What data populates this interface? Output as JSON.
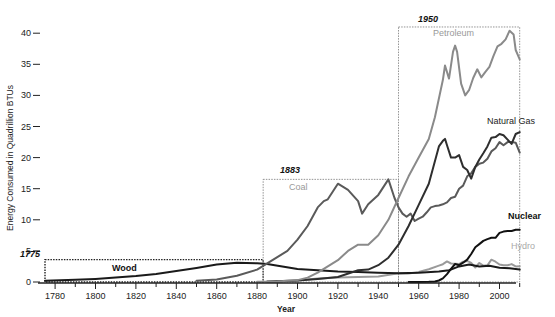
{
  "chart_data": {
    "type": "line",
    "title": "",
    "xlabel": "Year",
    "ylabel": "Energy Consumed in Quadrillion BTUs",
    "xlim": [
      1775,
      2010
    ],
    "ylim": [
      0,
      41
    ],
    "x_ticks": [
      1780,
      1800,
      1820,
      1840,
      1860,
      1880,
      1900,
      1920,
      1940,
      1960,
      1980,
      2000
    ],
    "y_ticks": [
      0,
      5,
      10,
      15,
      20,
      25,
      30,
      35,
      40
    ],
    "grid": false,
    "legend": "inline labels",
    "annotations": [
      {
        "label": "1775",
        "box": {
          "x0": 1775,
          "x1": 1883,
          "y0": 0,
          "y1": 3.6
        }
      },
      {
        "label": "1883",
        "box": {
          "x0": 1883,
          "x1": 1950,
          "y0": 0,
          "y1": 16.5
        }
      },
      {
        "label": "1950",
        "box": {
          "x0": 1950,
          "x1": 2010,
          "y0": 0,
          "y1": 41
        }
      }
    ],
    "series": [
      {
        "name": "Wood",
        "color": "#1a1a1a",
        "label_pos": [
          1812,
          2.5
        ],
        "points": [
          [
            1775,
            0.2
          ],
          [
            1790,
            0.35
          ],
          [
            1800,
            0.5
          ],
          [
            1810,
            0.7
          ],
          [
            1820,
            0.95
          ],
          [
            1830,
            1.3
          ],
          [
            1840,
            1.75
          ],
          [
            1850,
            2.25
          ],
          [
            1860,
            2.8
          ],
          [
            1870,
            3.1
          ],
          [
            1880,
            3.0
          ],
          [
            1885,
            2.9
          ],
          [
            1900,
            2.1
          ],
          [
            1910,
            1.9
          ],
          [
            1920,
            1.7
          ],
          [
            1930,
            1.6
          ],
          [
            1940,
            1.5
          ],
          [
            1950,
            1.4
          ],
          [
            1960,
            1.5
          ],
          [
            1970,
            1.7
          ],
          [
            1975,
            1.9
          ],
          [
            1980,
            2.5
          ],
          [
            1985,
            2.8
          ],
          [
            1990,
            2.5
          ],
          [
            1995,
            2.6
          ],
          [
            2000,
            2.3
          ],
          [
            2005,
            2.2
          ],
          [
            2010,
            2.0
          ]
        ]
      },
      {
        "name": "Coal",
        "color": "#5a5a5a",
        "label_pos": [
          1886,
          15.0
        ],
        "points": [
          [
            1850,
            0.2
          ],
          [
            1860,
            0.4
          ],
          [
            1870,
            1.0
          ],
          [
            1880,
            2.0
          ],
          [
            1885,
            3.0
          ],
          [
            1890,
            4.0
          ],
          [
            1895,
            5.0
          ],
          [
            1900,
            6.8
          ],
          [
            1905,
            9.0
          ],
          [
            1910,
            12.0
          ],
          [
            1913,
            13.0
          ],
          [
            1915,
            13.3
          ],
          [
            1920,
            15.8
          ],
          [
            1925,
            14.8
          ],
          [
            1930,
            13.0
          ],
          [
            1932,
            11.0
          ],
          [
            1935,
            12.5
          ],
          [
            1940,
            14.0
          ],
          [
            1945,
            16.5
          ],
          [
            1948,
            13.5
          ],
          [
            1950,
            12.0
          ],
          [
            1952,
            11.0
          ],
          [
            1954,
            10.5
          ],
          [
            1956,
            11.0
          ],
          [
            1958,
            9.8
          ],
          [
            1960,
            10.2
          ],
          [
            1962,
            10.5
          ],
          [
            1964,
            11.2
          ],
          [
            1966,
            12.0
          ],
          [
            1968,
            12.2
          ],
          [
            1970,
            12.3
          ],
          [
            1972,
            12.5
          ],
          [
            1974,
            12.8
          ],
          [
            1976,
            13.5
          ],
          [
            1978,
            13.7
          ],
          [
            1980,
            15.0
          ],
          [
            1982,
            15.5
          ],
          [
            1984,
            17.0
          ],
          [
            1986,
            17.5
          ],
          [
            1988,
            18.5
          ],
          [
            1990,
            19.0
          ],
          [
            1992,
            19.2
          ],
          [
            1994,
            19.8
          ],
          [
            1996,
            21.0
          ],
          [
            1998,
            21.5
          ],
          [
            2000,
            22.5
          ],
          [
            2002,
            22.0
          ],
          [
            2004,
            22.5
          ],
          [
            2006,
            22.5
          ],
          [
            2008,
            22.4
          ],
          [
            2010,
            20.8
          ]
        ]
      },
      {
        "name": "Petroleum",
        "color": "#8a8a8a",
        "label_pos": [
          1955,
          38.5
        ],
        "points": [
          [
            1880,
            0.05
          ],
          [
            1890,
            0.1
          ],
          [
            1900,
            0.3
          ],
          [
            1905,
            0.7
          ],
          [
            1910,
            1.5
          ],
          [
            1915,
            2.5
          ],
          [
            1920,
            3.5
          ],
          [
            1925,
            5.0
          ],
          [
            1930,
            6.0
          ],
          [
            1935,
            6.0
          ],
          [
            1940,
            7.5
          ],
          [
            1945,
            10.0
          ],
          [
            1950,
            13.5
          ],
          [
            1955,
            17.0
          ],
          [
            1960,
            20.0
          ],
          [
            1965,
            23.0
          ],
          [
            1968,
            26.5
          ],
          [
            1970,
            29.5
          ],
          [
            1972,
            32.5
          ],
          [
            1973,
            34.8
          ],
          [
            1975,
            32.7
          ],
          [
            1977,
            37.0
          ],
          [
            1978,
            38.0
          ],
          [
            1979,
            37.0
          ],
          [
            1981,
            31.9
          ],
          [
            1983,
            30.0
          ],
          [
            1985,
            30.9
          ],
          [
            1987,
            32.8
          ],
          [
            1989,
            34.2
          ],
          [
            1991,
            32.9
          ],
          [
            1993,
            33.8
          ],
          [
            1995,
            34.6
          ],
          [
            1997,
            36.3
          ],
          [
            1999,
            37.9
          ],
          [
            2001,
            38.3
          ],
          [
            2003,
            39.0
          ],
          [
            2005,
            40.4
          ],
          [
            2007,
            39.8
          ],
          [
            2008,
            37.3
          ],
          [
            2010,
            35.8
          ]
        ]
      },
      {
        "name": "Natural Gas",
        "color": "#2e2e2e",
        "label_pos": [
          1982,
          26.0
        ],
        "points": [
          [
            1885,
            0.1
          ],
          [
            1900,
            0.25
          ],
          [
            1910,
            0.5
          ],
          [
            1920,
            0.8
          ],
          [
            1930,
            1.9
          ],
          [
            1935,
            2.0
          ],
          [
            1940,
            2.7
          ],
          [
            1945,
            3.9
          ],
          [
            1950,
            6.0
          ],
          [
            1955,
            9.0
          ],
          [
            1960,
            12.4
          ],
          [
            1965,
            15.8
          ],
          [
            1970,
            21.8
          ],
          [
            1972,
            22.7
          ],
          [
            1973,
            23.0
          ],
          [
            1974,
            22.0
          ],
          [
            1976,
            20.0
          ],
          [
            1978,
            20.0
          ],
          [
            1980,
            20.4
          ],
          [
            1982,
            18.5
          ],
          [
            1984,
            18.0
          ],
          [
            1986,
            16.6
          ],
          [
            1988,
            18.5
          ],
          [
            1990,
            19.7
          ],
          [
            1992,
            20.7
          ],
          [
            1994,
            21.8
          ],
          [
            1996,
            23.2
          ],
          [
            1998,
            23.3
          ],
          [
            2000,
            23.8
          ],
          [
            2002,
            23.6
          ],
          [
            2004,
            22.9
          ],
          [
            2006,
            22.2
          ],
          [
            2008,
            23.8
          ],
          [
            2010,
            24.1
          ]
        ]
      },
      {
        "name": "Nuclear",
        "color": "#111111",
        "label_pos": [
          1994,
          10.5
        ],
        "points": [
          [
            1955,
            0.0
          ],
          [
            1960,
            0.01
          ],
          [
            1965,
            0.04
          ],
          [
            1968,
            0.1
          ],
          [
            1970,
            0.24
          ],
          [
            1972,
            0.58
          ],
          [
            1974,
            1.27
          ],
          [
            1976,
            2.1
          ],
          [
            1978,
            2.9
          ],
          [
            1980,
            2.7
          ],
          [
            1982,
            3.1
          ],
          [
            1984,
            3.6
          ],
          [
            1986,
            4.5
          ],
          [
            1988,
            5.6
          ],
          [
            1990,
            6.1
          ],
          [
            1992,
            6.6
          ],
          [
            1994,
            6.9
          ],
          [
            1996,
            7.1
          ],
          [
            1998,
            7.1
          ],
          [
            2000,
            7.9
          ],
          [
            2002,
            8.1
          ],
          [
            2004,
            8.2
          ],
          [
            2006,
            8.2
          ],
          [
            2008,
            8.4
          ],
          [
            2010,
            8.4
          ]
        ]
      },
      {
        "name": "Hydro",
        "color": "#9a9a9a",
        "label_pos": [
          1996,
          5.7
        ],
        "points": [
          [
            1885,
            0.0
          ],
          [
            1890,
            0.02
          ],
          [
            1900,
            0.25
          ],
          [
            1910,
            0.54
          ],
          [
            1920,
            0.74
          ],
          [
            1930,
            0.79
          ],
          [
            1940,
            0.88
          ],
          [
            1950,
            1.42
          ],
          [
            1955,
            1.36
          ],
          [
            1960,
            1.61
          ],
          [
            1965,
            2.06
          ],
          [
            1970,
            2.63
          ],
          [
            1972,
            2.86
          ],
          [
            1974,
            3.31
          ],
          [
            1976,
            2.98
          ],
          [
            1978,
            2.94
          ],
          [
            1980,
            2.9
          ],
          [
            1982,
            3.27
          ],
          [
            1984,
            3.39
          ],
          [
            1986,
            3.07
          ],
          [
            1988,
            2.33
          ],
          [
            1990,
            3.05
          ],
          [
            1992,
            2.62
          ],
          [
            1994,
            2.68
          ],
          [
            1996,
            3.59
          ],
          [
            1998,
            3.27
          ],
          [
            2000,
            2.81
          ],
          [
            2002,
            2.69
          ],
          [
            2004,
            2.69
          ],
          [
            2006,
            2.87
          ],
          [
            2008,
            2.51
          ],
          [
            2010,
            2.54
          ]
        ]
      }
    ]
  },
  "axes": {
    "xlabel": "Year",
    "ylabel": "Energy Consumed in Quadrillion BTUs"
  },
  "eras": [
    {
      "year_label": "1775"
    },
    {
      "year_label": "1883"
    },
    {
      "year_label": "1950"
    }
  ],
  "labels": {
    "wood": "Wood",
    "coal": "Coal",
    "petroleum": "Petroleum",
    "natural_gas": "Natural Gas",
    "nuclear": "Nuclear",
    "hydro": "Hydro"
  }
}
